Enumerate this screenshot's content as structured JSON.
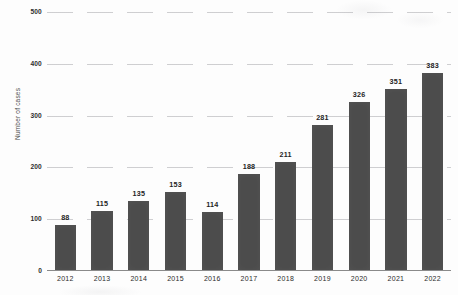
{
  "chart_data": {
    "type": "bar",
    "title": "",
    "xlabel": "",
    "ylabel": "Number of cases",
    "categories": [
      "2012",
      "2013",
      "2014",
      "2015",
      "2016",
      "2017",
      "2018",
      "2019",
      "2020",
      "2021",
      "2022"
    ],
    "values": [
      88,
      115,
      135,
      153,
      114,
      188,
      211,
      281,
      326,
      351,
      383
    ],
    "ylim": [
      0,
      500
    ],
    "yticks": [
      0,
      100,
      200,
      300,
      400,
      500
    ],
    "ytick_labels": [
      "0",
      "100",
      "200",
      "300",
      "400",
      "500"
    ],
    "grid": true,
    "legend": false,
    "data_labels": [
      "88",
      "115",
      "135",
      "153",
      "114",
      "188",
      "211",
      "281",
      "326",
      "351",
      "383"
    ],
    "colors": {
      "bar": "#4c4c4c",
      "background": "#fdfdfd",
      "gridline": "#969699",
      "axis": "#8a8a8a",
      "text": "#2b2b2b"
    }
  }
}
